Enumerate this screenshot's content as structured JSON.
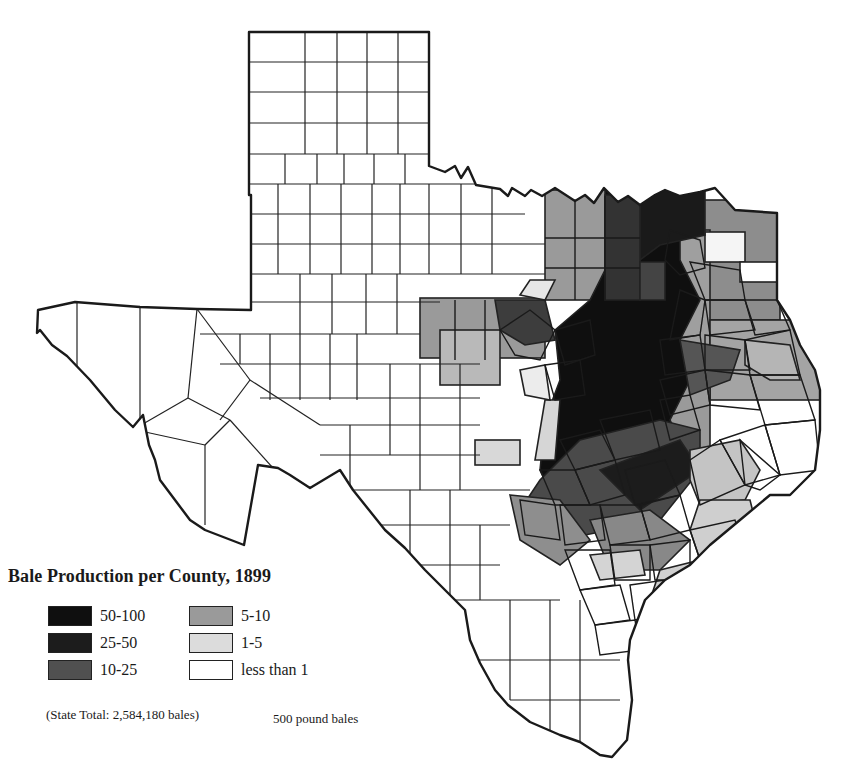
{
  "map": {
    "title": "Bale Production per County, 1899",
    "subject": "Texas cotton bale production by county",
    "legend": {
      "items": [
        {
          "label": "50-100",
          "color": "#0f0f0f"
        },
        {
          "label": "25-50",
          "color": "#1c1c1c"
        },
        {
          "label": "10-25",
          "color": "#505050"
        },
        {
          "label": "5-10",
          "color": "#9a9a9a"
        },
        {
          "label": "1-5",
          "color": "#dcdcdc"
        },
        {
          "label": "less than 1",
          "color": "#ffffff"
        }
      ]
    },
    "state_total": "(State Total: 2,584,180 bales)",
    "unit_note": "500 pound bales"
  }
}
